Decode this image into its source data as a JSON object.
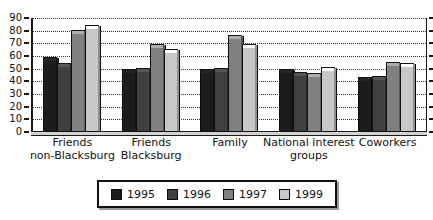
{
  "chart_data": {
    "type": "bar",
    "title": "",
    "subtitle": "",
    "xlabel": "",
    "ylabel": "",
    "ylim": [
      0,
      90
    ],
    "ytick_step": 10,
    "grid": true,
    "grid_style": "dotted horizontal",
    "legend_position": "bottom",
    "categories": [
      "Friends non-Blacksburg",
      "Friends Blacksburg",
      "Family",
      "National interest groups",
      "Coworkers"
    ],
    "category_lines": [
      [
        "Friends",
        "non-Blacksburg"
      ],
      [
        "Friends",
        "Blacksburg"
      ],
      [
        "Family"
      ],
      [
        "National interest",
        "groups"
      ],
      [
        "Coworkers"
      ]
    ],
    "ytick_labels": [
      "90",
      "80",
      "70",
      "60",
      "50",
      "40",
      "30",
      "20",
      "10",
      "0"
    ],
    "series": [
      {
        "name": "1995",
        "color": "#1c1c1c",
        "values": [
          57,
          47,
          47,
          47,
          41
        ]
      },
      {
        "name": "1996",
        "color": "#404040",
        "values": [
          52,
          48,
          48,
          45,
          42
        ]
      },
      {
        "name": "1997",
        "color": "#808080",
        "values": [
          78,
          67,
          74,
          44,
          53
        ]
      },
      {
        "name": "1999",
        "color": "#c8c8c8",
        "values": [
          82,
          63,
          67,
          49,
          52
        ]
      }
    ]
  },
  "legend": {
    "entries": [
      {
        "label": "1995",
        "color": "#1c1c1c"
      },
      {
        "label": "1996",
        "color": "#404040"
      },
      {
        "label": "1997",
        "color": "#808080"
      },
      {
        "label": "1999",
        "color": "#c8c8c8"
      }
    ]
  }
}
